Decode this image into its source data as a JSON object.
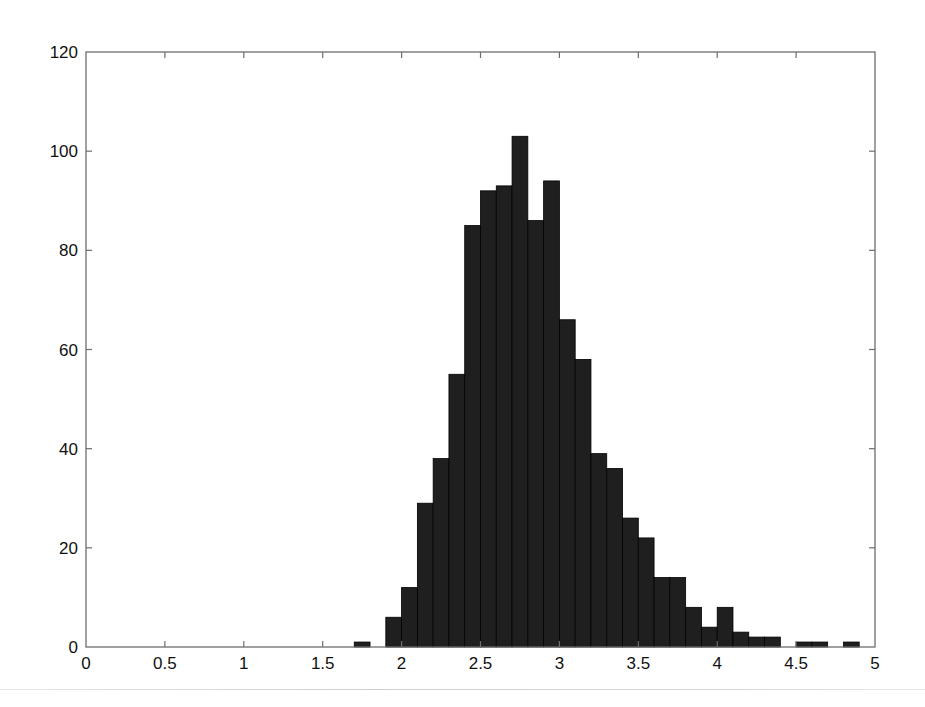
{
  "chart_data": {
    "type": "bar",
    "subtype": "histogram",
    "title": "",
    "xlabel": "",
    "ylabel": "",
    "xlim": [
      0,
      5
    ],
    "ylim": [
      0,
      120
    ],
    "grid": false,
    "legend": null,
    "bin_width": 0.1,
    "x_ticks": [
      "0",
      "0.5",
      "1",
      "1.5",
      "2",
      "2.5",
      "3",
      "3.5",
      "4",
      "4.5",
      "5"
    ],
    "y_ticks": [
      "0",
      "20",
      "40",
      "60",
      "80",
      "100",
      "120"
    ],
    "bin_edges_start": [
      1.7,
      1.8,
      1.9,
      2.0,
      2.1,
      2.2,
      2.3,
      2.4,
      2.5,
      2.6,
      2.7,
      2.8,
      2.9,
      3.0,
      3.1,
      3.2,
      3.3,
      3.4,
      3.5,
      3.6,
      3.7,
      3.8,
      3.9,
      4.0,
      4.1,
      4.2,
      4.3,
      4.4,
      4.5,
      4.6,
      4.7,
      4.8
    ],
    "values": [
      1,
      0,
      6,
      12,
      29,
      38,
      55,
      85,
      92,
      93,
      103,
      86,
      94,
      66,
      58,
      39,
      36,
      26,
      22,
      14,
      14,
      8,
      4,
      8,
      3,
      2,
      2,
      0,
      1,
      1,
      0,
      1
    ],
    "colors": {
      "bar_fill": "#1f1f1f",
      "bar_edge": "#000000",
      "axis": "#6e6e6e",
      "text": "#111111"
    }
  },
  "layout": {
    "plot_left": 86,
    "plot_right": 875,
    "plot_top": 52,
    "plot_bottom": 647
  }
}
